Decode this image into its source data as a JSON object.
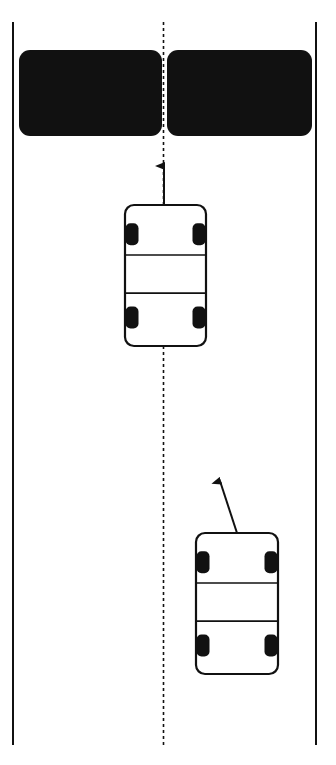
{
  "diagram": {
    "type": "road-overtaking-scene",
    "colors": {
      "background": "#ffffff",
      "line": "#111111",
      "obstacle": "#111111"
    },
    "road": {
      "left_edge": {
        "x": 13,
        "y1": 22,
        "y2": 745
      },
      "right_edge": {
        "x": 316,
        "y1": 22,
        "y2": 745
      },
      "center_dashed_line": {
        "x": 163.5,
        "y1": 22,
        "y2": 745
      }
    },
    "obstacles": [
      {
        "name": "left-lane-obstacle",
        "x": 19,
        "y": 50,
        "w": 143,
        "h": 86
      },
      {
        "name": "right-lane-obstacle",
        "x": 167,
        "y": 50,
        "w": 145,
        "h": 86
      }
    ],
    "cars": [
      {
        "name": "car-center",
        "x": 125,
        "y": 205,
        "w": 81,
        "h": 141,
        "arrow": {
          "x1": 164,
          "y1": 205,
          "x2": 164,
          "y2": 166
        }
      },
      {
        "name": "car-right",
        "x": 196,
        "y": 533,
        "w": 82,
        "h": 141,
        "arrow": {
          "x1": 237,
          "y1": 533,
          "x2": 220,
          "y2": 481
        }
      }
    ]
  }
}
